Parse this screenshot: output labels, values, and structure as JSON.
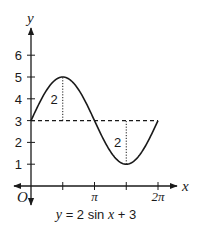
{
  "chart_data": {
    "type": "line",
    "title": "",
    "caption": "y = 2 sin x + 3",
    "caption_parts": {
      "y": "y",
      "eq": " = 2 sin ",
      "x": "x",
      "rest": " + 3"
    },
    "xlabel": "x",
    "ylabel": "y",
    "origin_label": "O",
    "function": "2*sin(x)+3",
    "xlim": [
      0,
      6.2832
    ],
    "ylim": [
      0,
      6
    ],
    "x_ticks": [
      {
        "value": 1.5708,
        "label": ""
      },
      {
        "value": 3.1416,
        "label": "π"
      },
      {
        "value": 4.7124,
        "label": ""
      },
      {
        "value": 6.2832,
        "label": "2π"
      }
    ],
    "y_ticks": [
      {
        "value": 1,
        "label": "1"
      },
      {
        "value": 2,
        "label": "2"
      },
      {
        "value": 3,
        "label": "3"
      },
      {
        "value": 4,
        "label": "4"
      },
      {
        "value": 5,
        "label": "5"
      },
      {
        "value": 6,
        "label": "6"
      }
    ],
    "series": [
      {
        "name": "y = 2 sin x + 3",
        "x_range": [
          0,
          6.2832
        ],
        "style": "solid"
      }
    ],
    "midline": {
      "y": 3,
      "x_range": [
        0,
        6.2832
      ],
      "style": "dashed"
    },
    "annotations": [
      {
        "type": "amplitude",
        "x": 1.5708,
        "from": 3,
        "to": 5,
        "label": "2"
      },
      {
        "type": "amplitude",
        "x": 4.7124,
        "from": 1,
        "to": 3,
        "label": "2"
      }
    ],
    "grid": false
  }
}
